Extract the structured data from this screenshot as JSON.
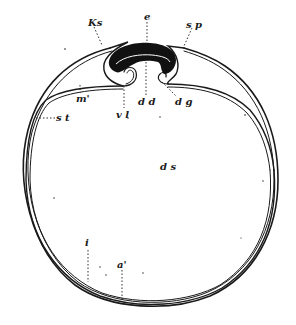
{
  "figure": {
    "labels": {
      "ks": {
        "text": "Ks",
        "x": 88,
        "y": 18
      },
      "e": {
        "text": "e",
        "x": 145,
        "y": 14
      },
      "sp": {
        "text": "s p",
        "x": 186,
        "y": 21
      },
      "m": {
        "text": "m'",
        "x": 77,
        "y": 95
      },
      "vl": {
        "text": "v l",
        "x": 117,
        "y": 111
      },
      "dd": {
        "text": "d d",
        "x": 139,
        "y": 98
      },
      "dg": {
        "text": "d g",
        "x": 175,
        "y": 98
      },
      "st": {
        "text": "s t",
        "x": 56,
        "y": 114
      },
      "ds": {
        "text": "d s",
        "x": 161,
        "y": 163
      },
      "i": {
        "text": "i",
        "x": 86,
        "y": 240
      },
      "a": {
        "text": "a'",
        "x": 118,
        "y": 262
      }
    },
    "colors": {
      "ink": "#1a1a1a",
      "paper": "#ffffff"
    }
  }
}
